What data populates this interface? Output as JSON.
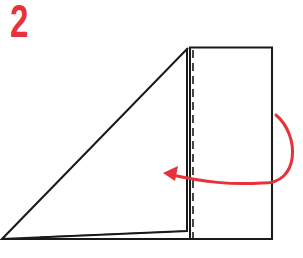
{
  "step": {
    "number": "2"
  },
  "colors": {
    "accent": "#e8323a",
    "line": "#1a1a1a",
    "background": "#ffffff"
  },
  "diagram": {
    "elements": [
      "folded-triangle",
      "rectangle-panel",
      "dashed-fold-line",
      "fold-arrow"
    ]
  }
}
